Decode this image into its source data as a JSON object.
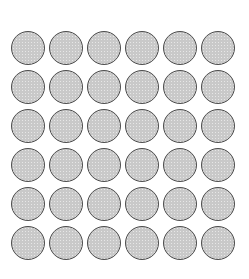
{
  "canvas": {
    "width": 249,
    "height": 279,
    "background_color": "#ffffff"
  },
  "grid": {
    "name": "circle-grid",
    "columns": 6,
    "rows": 6,
    "total_shapes": 36,
    "shape": "circle",
    "diameter": 34,
    "column_pitch": 38,
    "row_pitch": 39,
    "offset_x": 11,
    "offset_y": 31,
    "fill_color": "#c9c9c9",
    "border_color": "#4c4c4c",
    "border_width": 1.5
  },
  "chart_data": {
    "type": "scatter",
    "title": "",
    "subtitle": "",
    "xlabel": "",
    "ylabel": "",
    "grid": false,
    "legend": null,
    "annotations": [],
    "marker": {
      "shape": "circle",
      "size": 34,
      "facecolor": "#c9c9c9",
      "edgecolor": "#4c4c4c",
      "edgewidth": 1.5
    },
    "xlim": [
      0,
      249
    ],
    "ylim": [
      0,
      279
    ],
    "x": [
      11,
      49,
      87,
      125,
      163,
      201,
      11,
      49,
      87,
      125,
      163,
      201,
      11,
      49,
      87,
      125,
      163,
      201,
      11,
      49,
      87,
      125,
      163,
      201,
      11,
      49,
      87,
      125,
      163,
      201,
      11,
      49,
      87,
      125,
      163,
      201
    ],
    "y": [
      31,
      31,
      31,
      31,
      31,
      31,
      70,
      70,
      70,
      70,
      70,
      70,
      109,
      109,
      109,
      109,
      109,
      109,
      148,
      148,
      148,
      148,
      148,
      148,
      187,
      187,
      187,
      187,
      187,
      187,
      226,
      226,
      226,
      226,
      226,
      226
    ],
    "row_index": [
      1,
      1,
      1,
      1,
      1,
      1,
      2,
      2,
      2,
      2,
      2,
      2,
      3,
      3,
      3,
      3,
      3,
      3,
      4,
      4,
      4,
      4,
      4,
      4,
      5,
      5,
      5,
      5,
      5,
      5,
      6,
      6,
      6,
      6,
      6,
      6
    ],
    "column_index": [
      1,
      2,
      3,
      4,
      5,
      6,
      1,
      2,
      3,
      4,
      5,
      6,
      1,
      2,
      3,
      4,
      5,
      6,
      1,
      2,
      3,
      4,
      5,
      6,
      1,
      2,
      3,
      4,
      5,
      6,
      1,
      2,
      3,
      4,
      5,
      6
    ]
  }
}
